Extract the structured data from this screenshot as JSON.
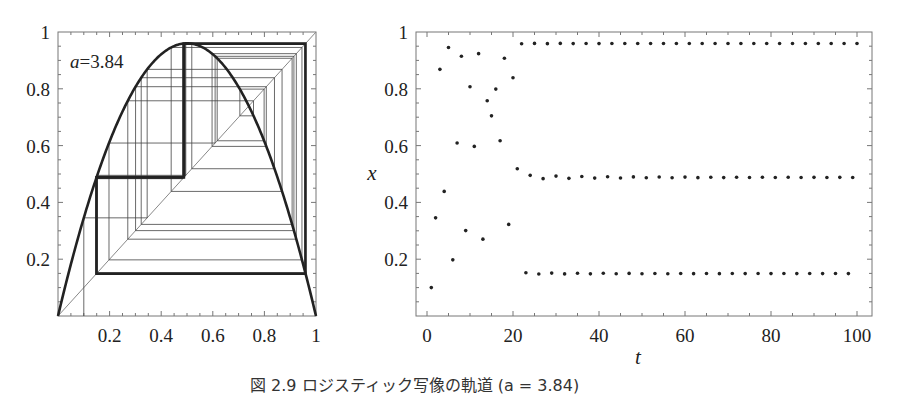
{
  "chart_data": [
    {
      "type": "line",
      "title": "Cobweb diagram of logistic map",
      "annotation": "a=3.84",
      "parameter_a": 3.84,
      "x0": 0.1,
      "xlabel": "",
      "ylabel": "",
      "xlim": [
        0,
        1
      ],
      "ylim": [
        0,
        1
      ],
      "xticks": [
        "0.2",
        "0.4",
        "0.6",
        "0.8",
        "1"
      ],
      "yticks": [
        "0.2",
        "0.4",
        "0.6",
        "0.8",
        "1"
      ],
      "series": [
        {
          "name": "f(x)=a x (1-x)",
          "style": "thick"
        },
        {
          "name": "y=x",
          "style": "thin"
        },
        {
          "name": "cobweb",
          "style": "thin"
        },
        {
          "name": "period-3 cycle",
          "values": [
            0.149,
            0.488,
            0.959
          ],
          "style": "thick"
        }
      ]
    },
    {
      "type": "scatter",
      "title": "",
      "xlabel": "t",
      "ylabel": "x",
      "xlim": [
        -2.5,
        103.5
      ],
      "ylim": [
        0,
        1
      ],
      "xticks": [
        "0",
        "20",
        "40",
        "60",
        "80",
        "100"
      ],
      "yticks": [
        "0.2",
        "0.4",
        "0.6",
        "0.8",
        "1"
      ],
      "series": [
        {
          "name": "x_t",
          "t_range": [
            1,
            100
          ],
          "x0": 0.1,
          "rule": "x_{t+1}=3.84 x_t (1-x_t)",
          "attractor": [
            0.149,
            0.488,
            0.959
          ]
        }
      ]
    }
  ],
  "left": {
    "annotation_var": "a",
    "annotation_eq": "=3.84"
  },
  "right": {
    "xlabel": "t",
    "ylabel": "x"
  },
  "caption": "図 2.9 ロジスティック写像の軌道 (a = 3.84)"
}
